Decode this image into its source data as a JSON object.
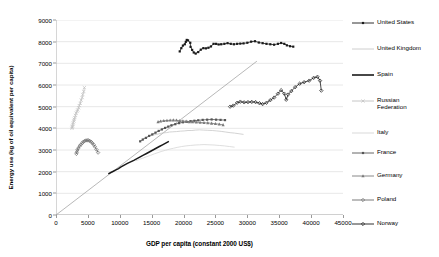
{
  "chart_data": {
    "type": "scatter",
    "title": "",
    "xlabel": "GDP per capita (constant 2000 US$)",
    "ylabel": "Energy use (kg of oil equivalent per capita)",
    "xlim": [
      0,
      45000
    ],
    "ylim": [
      0,
      9000
    ],
    "xticks": [
      0,
      5000,
      10000,
      15000,
      20000,
      25000,
      30000,
      35000,
      40000,
      45000
    ],
    "yticks": [
      0,
      1000,
      2000,
      3000,
      4000,
      5000,
      6000,
      7000,
      8000,
      9000
    ],
    "grid": "horizontal",
    "legend_position": "right",
    "reference_line": {
      "name": "diagonal-reference-line",
      "x": [
        0,
        31500
      ],
      "y": [
        0,
        7100
      ],
      "color": "#9a9a9a"
    },
    "series": [
      {
        "name": "United States",
        "color": "#1a1a1a",
        "marker": "square",
        "points": [
          [
            19400,
            7550
          ],
          [
            19650,
            7700
          ],
          [
            19900,
            7820
          ],
          [
            20200,
            7880
          ],
          [
            20350,
            7990
          ],
          [
            20500,
            8080
          ],
          [
            20700,
            8060
          ],
          [
            21050,
            7950
          ],
          [
            21100,
            7760
          ],
          [
            21350,
            7620
          ],
          [
            21600,
            7500
          ],
          [
            21900,
            7450
          ],
          [
            22300,
            7520
          ],
          [
            22700,
            7630
          ],
          [
            23100,
            7700
          ],
          [
            23500,
            7690
          ],
          [
            23900,
            7720
          ],
          [
            24300,
            7780
          ],
          [
            24700,
            7900
          ],
          [
            25100,
            7900
          ],
          [
            25500,
            7870
          ],
          [
            25900,
            7880
          ],
          [
            26400,
            7900
          ],
          [
            26900,
            7930
          ],
          [
            27400,
            7900
          ],
          [
            27900,
            7880
          ],
          [
            28400,
            7900
          ],
          [
            28900,
            7910
          ],
          [
            29400,
            7920
          ],
          [
            30000,
            7950
          ],
          [
            30600,
            8000
          ],
          [
            31200,
            8020
          ],
          [
            31800,
            7960
          ],
          [
            32400,
            7930
          ],
          [
            33000,
            7900
          ],
          [
            33600,
            7880
          ],
          [
            34200,
            7860
          ],
          [
            34800,
            7900
          ],
          [
            35300,
            7940
          ],
          [
            35800,
            7900
          ],
          [
            36200,
            7830
          ],
          [
            36700,
            7790
          ],
          [
            37200,
            7770
          ]
        ]
      },
      {
        "name": "United Kingdom",
        "color": "#c8c8c8",
        "marker": "none",
        "points": [
          [
            13500,
            3500
          ],
          [
            13900,
            3560
          ],
          [
            14300,
            3600
          ],
          [
            14800,
            3650
          ],
          [
            15300,
            3700
          ],
          [
            15800,
            3720
          ],
          [
            16300,
            3760
          ],
          [
            16800,
            3790
          ],
          [
            17300,
            3800
          ],
          [
            17800,
            3830
          ],
          [
            18300,
            3840
          ],
          [
            18900,
            3850
          ],
          [
            19500,
            3870
          ],
          [
            20100,
            3880
          ],
          [
            20700,
            3900
          ],
          [
            21300,
            3900
          ],
          [
            21900,
            3920
          ],
          [
            22500,
            3930
          ],
          [
            23100,
            3920
          ],
          [
            23800,
            3910
          ],
          [
            24500,
            3900
          ],
          [
            25200,
            3880
          ],
          [
            25900,
            3860
          ],
          [
            26600,
            3830
          ],
          [
            27300,
            3800
          ],
          [
            28000,
            3780
          ],
          [
            28700,
            3750
          ],
          [
            29400,
            3720
          ]
        ]
      },
      {
        "name": "Spain",
        "color": "#1a1a1a",
        "marker": "none",
        "points": [
          [
            8200,
            1900
          ],
          [
            8600,
            1960
          ],
          [
            9000,
            2020
          ],
          [
            9400,
            2080
          ],
          [
            9800,
            2140
          ],
          [
            10200,
            2220
          ],
          [
            10700,
            2300
          ],
          [
            11200,
            2380
          ],
          [
            11700,
            2450
          ],
          [
            12200,
            2520
          ],
          [
            12700,
            2600
          ],
          [
            13200,
            2680
          ],
          [
            13700,
            2760
          ],
          [
            14200,
            2840
          ],
          [
            14700,
            2920
          ],
          [
            15200,
            3000
          ],
          [
            15700,
            3080
          ],
          [
            16200,
            3160
          ],
          [
            16700,
            3240
          ],
          [
            17200,
            3320
          ],
          [
            17700,
            3400
          ]
        ]
      },
      {
        "name": "Russian Federation",
        "color": "#c0c0c0",
        "marker": "cross",
        "points": [
          [
            4450,
            5880
          ],
          [
            4350,
            5700
          ],
          [
            4200,
            5560
          ],
          [
            4100,
            5420
          ],
          [
            3950,
            5300
          ],
          [
            3800,
            5150
          ],
          [
            3650,
            5050
          ],
          [
            3550,
            4950
          ],
          [
            3400,
            4850
          ],
          [
            3300,
            4780
          ],
          [
            3150,
            4700
          ],
          [
            3050,
            4600
          ],
          [
            2950,
            4500
          ],
          [
            2850,
            4420
          ],
          [
            2800,
            4340
          ],
          [
            2700,
            4260
          ],
          [
            2650,
            4180
          ],
          [
            2600,
            4100
          ],
          [
            2550,
            4050
          ],
          [
            2500,
            4000
          ]
        ]
      },
      {
        "name": "Italy",
        "color": "#d5d5d5",
        "marker": "none",
        "points": [
          [
            12500,
            2500
          ],
          [
            13000,
            2560
          ],
          [
            13600,
            2620
          ],
          [
            14200,
            2690
          ],
          [
            14800,
            2750
          ],
          [
            15400,
            2820
          ],
          [
            16000,
            2880
          ],
          [
            16600,
            2940
          ],
          [
            17200,
            2990
          ],
          [
            17800,
            3040
          ],
          [
            18400,
            3080
          ],
          [
            19000,
            3120
          ],
          [
            19700,
            3160
          ],
          [
            20400,
            3190
          ],
          [
            21100,
            3210
          ],
          [
            21800,
            3230
          ],
          [
            22500,
            3240
          ],
          [
            23200,
            3250
          ],
          [
            24000,
            3240
          ],
          [
            24800,
            3230
          ],
          [
            25600,
            3210
          ],
          [
            26400,
            3190
          ],
          [
            27200,
            3160
          ],
          [
            28000,
            3130
          ]
        ]
      },
      {
        "name": "France",
        "color": "#555555",
        "marker": "square",
        "points": [
          [
            13200,
            3400
          ],
          [
            13600,
            3480
          ],
          [
            14100,
            3560
          ],
          [
            14600,
            3650
          ],
          [
            15100,
            3720
          ],
          [
            15600,
            3800
          ],
          [
            16100,
            3880
          ],
          [
            16600,
            3950
          ],
          [
            17100,
            4020
          ],
          [
            17600,
            4080
          ],
          [
            18100,
            4140
          ],
          [
            18700,
            4190
          ],
          [
            19300,
            4240
          ],
          [
            19900,
            4280
          ],
          [
            20500,
            4300
          ],
          [
            21100,
            4330
          ],
          [
            21700,
            4350
          ],
          [
            22300,
            4370
          ],
          [
            23000,
            4390
          ],
          [
            23700,
            4400
          ],
          [
            24400,
            4410
          ],
          [
            25100,
            4400
          ],
          [
            25800,
            4390
          ],
          [
            26500,
            4380
          ]
        ]
      },
      {
        "name": "Germany",
        "color": "#7a7a7a",
        "marker": "triangle",
        "points": [
          [
            16000,
            4300
          ],
          [
            16400,
            4330
          ],
          [
            16900,
            4350
          ],
          [
            17400,
            4360
          ],
          [
            17900,
            4370
          ],
          [
            18400,
            4380
          ],
          [
            18900,
            4370
          ],
          [
            19400,
            4350
          ],
          [
            19900,
            4340
          ],
          [
            20400,
            4320
          ],
          [
            20900,
            4300
          ],
          [
            21400,
            4290
          ],
          [
            22000,
            4280
          ],
          [
            22600,
            4270
          ],
          [
            23200,
            4260
          ],
          [
            23800,
            4250
          ],
          [
            24400,
            4230
          ],
          [
            25000,
            4210
          ],
          [
            25600,
            4190
          ],
          [
            26200,
            4160
          ]
        ]
      },
      {
        "name": "Poland",
        "color": "#6b6b6b",
        "marker": "diamond",
        "points": [
          [
            3200,
            2820
          ],
          [
            3250,
            2900
          ],
          [
            3350,
            3000
          ],
          [
            3500,
            3080
          ],
          [
            3700,
            3180
          ],
          [
            3900,
            3250
          ],
          [
            4100,
            3320
          ],
          [
            4300,
            3380
          ],
          [
            4500,
            3420
          ],
          [
            4700,
            3440
          ],
          [
            4900,
            3450
          ],
          [
            5100,
            3440
          ],
          [
            5300,
            3420
          ],
          [
            5500,
            3380
          ],
          [
            5700,
            3320
          ],
          [
            5900,
            3250
          ],
          [
            6100,
            3150
          ],
          [
            6350,
            3020
          ],
          [
            6600,
            2880
          ]
        ]
      },
      {
        "name": "Norway",
        "color": "#1a1a1a",
        "marker": "diamond",
        "points": [
          [
            27300,
            5000
          ],
          [
            27800,
            5050
          ],
          [
            28400,
            5180
          ],
          [
            28900,
            5230
          ],
          [
            29500,
            5200
          ],
          [
            30100,
            5210
          ],
          [
            30700,
            5220
          ],
          [
            31300,
            5210
          ],
          [
            31900,
            5160
          ],
          [
            32400,
            5120
          ],
          [
            33000,
            5180
          ],
          [
            33600,
            5300
          ],
          [
            34200,
            5420
          ],
          [
            34800,
            5600
          ],
          [
            35300,
            5760
          ],
          [
            35800,
            5600
          ],
          [
            36100,
            5320
          ],
          [
            36400,
            5560
          ],
          [
            36900,
            5720
          ],
          [
            37500,
            5900
          ],
          [
            38200,
            6060
          ],
          [
            38900,
            6130
          ],
          [
            39700,
            6200
          ],
          [
            40400,
            6330
          ],
          [
            41000,
            6380
          ],
          [
            41400,
            6200
          ],
          [
            41600,
            5740
          ]
        ]
      }
    ]
  },
  "legend": {
    "items": [
      {
        "label": "United States"
      },
      {
        "label": "United Kingdom"
      },
      {
        "label": "Spain"
      },
      {
        "label": "Russian\nFederation"
      },
      {
        "label": "Italy"
      },
      {
        "label": "France"
      },
      {
        "label": "Germany"
      },
      {
        "label": "Poland"
      },
      {
        "label": "Norway"
      }
    ]
  }
}
